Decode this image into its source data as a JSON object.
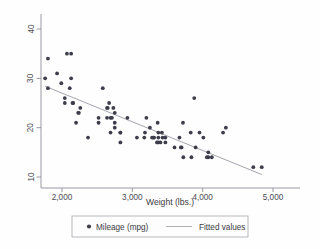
{
  "chart_data": {
    "type": "scatter",
    "title": "",
    "xlabel": "Weight (lbs.)",
    "ylabel": "",
    "xlim": [
      1650,
      5000
    ],
    "ylim": [
      8,
      43
    ],
    "grid": false,
    "legend_position": "bottom",
    "x_ticks": [
      2000,
      3000,
      4000,
      5000
    ],
    "x_tick_labels": [
      "2,000",
      "3,000",
      "4,000",
      "5,000"
    ],
    "y_ticks": [
      10,
      20,
      30,
      40
    ],
    "y_tick_labels": [
      "10",
      "20",
      "30",
      "40"
    ],
    "series": [
      {
        "name": "Mileage (mpg)",
        "type": "scatter",
        "marker": "circle",
        "color": "#3d3d4c",
        "x": [
          2930,
          3350,
          2640,
          3250,
          4080,
          3670,
          3880,
          4330,
          3900,
          4290,
          2110,
          2200,
          2150,
          2670,
          3700,
          3470,
          3600,
          3300,
          3690,
          3180,
          3400,
          2830,
          3370,
          2690,
          3310,
          2830,
          3370,
          4130,
          4080,
          3720,
          3955,
          3830,
          4010,
          4060,
          3360,
          3840,
          3725,
          4720,
          3065,
          3430,
          2580,
          2130,
          1800,
          2230,
          2130,
          2650,
          2750,
          3280,
          2750,
          3170,
          2710,
          2640,
          2730,
          2370,
          2690,
          3470,
          2070,
          2160,
          2040,
          1930,
          1990,
          3200,
          3370,
          3420,
          2520,
          2520,
          1800,
          1760,
          2040,
          2240,
          2260,
          2750,
          2830,
          4840
        ],
        "y": [
          22,
          17,
          22,
          20,
          15,
          18,
          26,
          20,
          16,
          19,
          28,
          21,
          25,
          25,
          16,
          18,
          16,
          18,
          16,
          19,
          17,
          19,
          17,
          19,
          18,
          19,
          18,
          14,
          14,
          21,
          19,
          19,
          18,
          14,
          21,
          14,
          14,
          12,
          18,
          18,
          28,
          30,
          34,
          23,
          35,
          24,
          21,
          18,
          23,
          18,
          22,
          24,
          24,
          18,
          22,
          17,
          35,
          25,
          26,
          31,
          29,
          22,
          19,
          19,
          21,
          22,
          28,
          30,
          25,
          23,
          24,
          20,
          17,
          12
        ]
      },
      {
        "name": "Fitted values",
        "type": "line",
        "color": "#9a9aa4",
        "x": [
          1760,
          4840
        ],
        "y": [
          28.4,
          10.5
        ]
      }
    ],
    "legend": [
      {
        "label": "Mileage (mpg)",
        "marker": "circle",
        "color": "#3d3d4c"
      },
      {
        "label": "Fitted values",
        "marker": "line",
        "color": "#9a9aa4"
      }
    ]
  },
  "axis": {
    "x_title": "Weight (lbs.)",
    "y_title": ""
  }
}
